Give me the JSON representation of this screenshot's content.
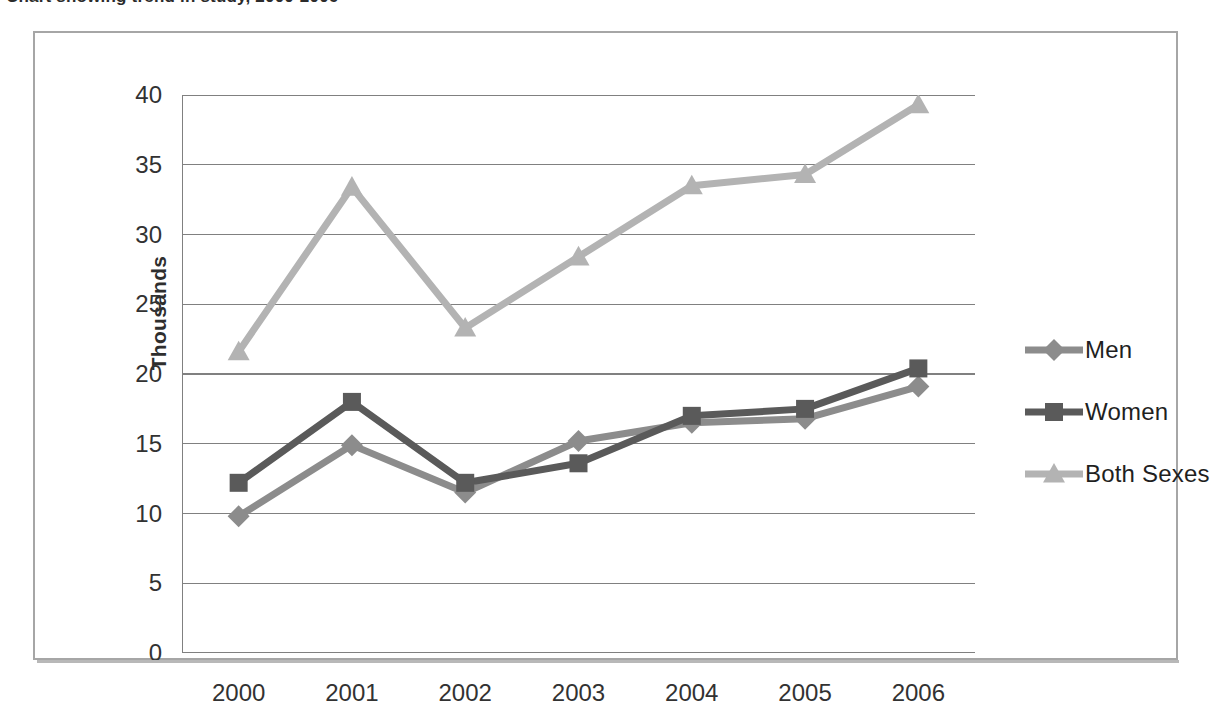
{
  "caption": {
    "text": "Chart showing trend in study, 2000-2006"
  },
  "chart_data": {
    "type": "line",
    "title": "",
    "subtitle": "",
    "xlabel": "",
    "ylabel": "Thousands",
    "categories": [
      "2000",
      "2001",
      "2002",
      "2003",
      "2004",
      "2005",
      "2006"
    ],
    "x": [
      2000,
      2001,
      2002,
      2003,
      2004,
      2005,
      2006
    ],
    "ylim": [
      0,
      40
    ],
    "ytick_labels": [
      "0",
      "5",
      "10",
      "15",
      "20",
      "25",
      "30",
      "35",
      "40"
    ],
    "ytick_values": [
      0,
      5,
      10,
      15,
      20,
      25,
      30,
      35,
      40
    ],
    "grid": "horizontal",
    "legend_position": "right",
    "series": [
      {
        "name": "Men",
        "marker": "diamond",
        "color": "#8c8c8c",
        "values": [
          9.8,
          14.9,
          11.5,
          15.2,
          16.5,
          16.8,
          19.1
        ]
      },
      {
        "name": "Women",
        "marker": "square",
        "color": "#5a5a5a",
        "values": [
          12.2,
          18.0,
          12.2,
          13.6,
          17.0,
          17.5,
          20.4
        ]
      },
      {
        "name": "Both Sexes",
        "marker": "triangle",
        "color": "#b3b3b3",
        "values": [
          21.6,
          33.4,
          23.3,
          28.4,
          33.5,
          34.3,
          39.3
        ]
      }
    ]
  },
  "axis": {
    "y_title": "Thousands",
    "y_ticks": [
      "40",
      "35",
      "30",
      "25",
      "20",
      "15",
      "10",
      "5",
      "0"
    ],
    "x_ticks": [
      "2000",
      "2001",
      "2002",
      "2003",
      "2004",
      "2005",
      "2006"
    ]
  },
  "legend": {
    "items": [
      {
        "label": "Men",
        "marker": "diamond-marker",
        "color": "#8c8c8c"
      },
      {
        "label": "Women",
        "marker": "square-marker",
        "color": "#5a5a5a"
      },
      {
        "label": "Both Sexes",
        "marker": "triangle-marker",
        "color": "#b3b3b3"
      }
    ]
  },
  "colors": {
    "men": "#8c8c8c",
    "women": "#5a5a5a",
    "both": "#b3b3b3",
    "gridline": "#808080",
    "axis": "#808080",
    "frame": "#a6a6a6"
  }
}
